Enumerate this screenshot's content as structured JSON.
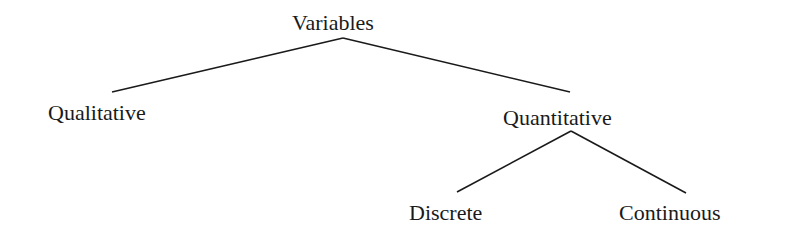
{
  "diagram": {
    "type": "tree",
    "root": "Variables",
    "nodes": {
      "variables": "Variables",
      "qualitative": "Qualitative",
      "quantitative": "Quantitative",
      "discrete": "Discrete",
      "continuous": "Continuous"
    },
    "edges": [
      {
        "from": "Variables",
        "to": "Qualitative"
      },
      {
        "from": "Variables",
        "to": "Quantitative"
      },
      {
        "from": "Quantitative",
        "to": "Discrete"
      },
      {
        "from": "Quantitative",
        "to": "Continuous"
      }
    ],
    "line_color": "#1a1a1a",
    "text_color": "#1a1a1a",
    "background": "#ffffff"
  }
}
